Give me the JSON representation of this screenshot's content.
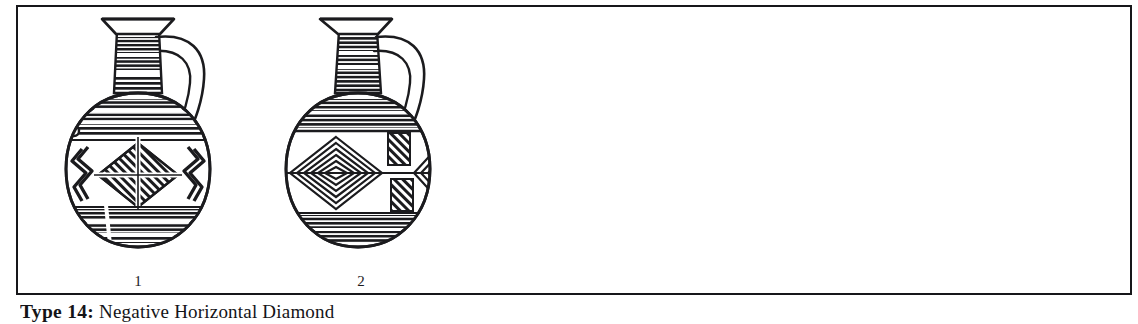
{
  "plate": {
    "caption_label": "Type 14:",
    "caption_text": " Negative Horizontal Diamond",
    "frame_color": "#17171a",
    "ink_color": "#1b1b1e",
    "background_color": "#ffffff"
  },
  "figure_items": [
    {
      "number": "1",
      "name": "globular-jug-with-crossed-diamond",
      "description": "Line drawing of a globular jug with trefoil flaring rim, tall horizontally banded neck, strap handle on the right, central diamond with white cross and hatched quadrants flanked by zigzag motifs, and horizontally hatched bands on the lower body."
    },
    {
      "number": "2",
      "name": "globular-jug-with-nested-diamond",
      "description": "Line drawing of a globular jug with trefoil flaring rim, tall horizontally banded neck, strap handle on the right, central nested concentric diamond motif, two offset hatched rectangles and a partial diamond at the right, and dense horizontal bands on the lower body."
    }
  ]
}
